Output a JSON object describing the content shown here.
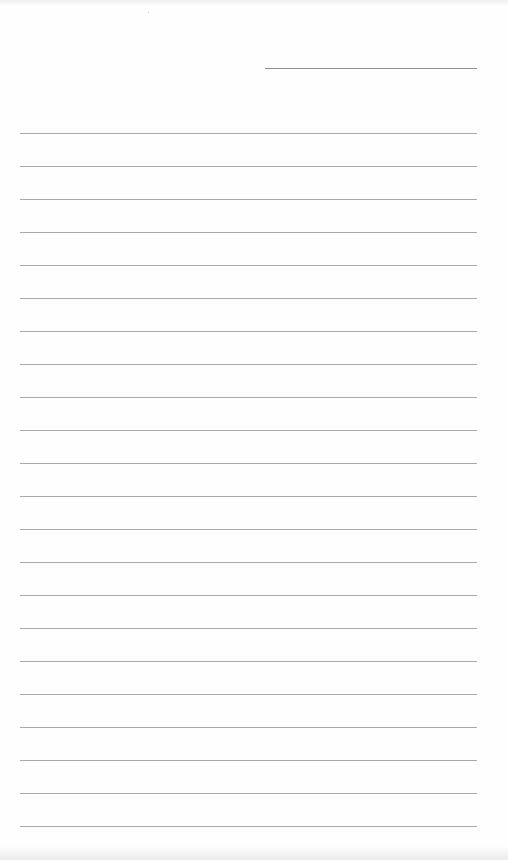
{
  "document": {
    "type": "lined-paper",
    "header_line": {
      "present": true
    },
    "rules": {
      "count": 22,
      "first_top": 133,
      "spacing": 33,
      "left": 20,
      "right": 477,
      "color": "#9a9a9a"
    },
    "text": ""
  }
}
